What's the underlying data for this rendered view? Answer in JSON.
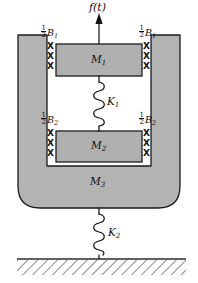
{
  "diagram": {
    "type": "mechanical-schematic",
    "colors": {
      "body_fill": "#b3b3b3",
      "block_fill": "#b0b0b0",
      "outline": "#1a1a1a",
      "ground_line": "#2b2b2b",
      "background": "#ffffff",
      "label_color": "#0d0d0d"
    },
    "force": {
      "label_main": "f",
      "label_paren_open": "(",
      "label_var": "t",
      "label_paren_close": ")",
      "label_full": "f(t)",
      "arrow_direction": "up",
      "icon": "up-arrow-icon"
    },
    "masses": [
      {
        "id": "M1",
        "label_main": "M",
        "label_sub": "1",
        "label_full": "M₁"
      },
      {
        "id": "M2",
        "label_main": "M",
        "label_sub": "2",
        "label_full": "M₂"
      },
      {
        "id": "M3",
        "label_main": "M",
        "label_sub": "3",
        "label_full": "M₃"
      }
    ],
    "springs": [
      {
        "id": "K1",
        "label_main": "K",
        "label_sub": "1",
        "label_full": "K₁",
        "between": "M1-M2"
      },
      {
        "id": "K2",
        "label_main": "K",
        "label_sub": "2",
        "label_full": "K₂",
        "between": "M3-ground"
      }
    ],
    "dampers": [
      {
        "id": "B1-left",
        "numerator": "1",
        "denominator": "2",
        "label_main": "B",
        "label_sub": "1",
        "label_full": "½B₁",
        "side": "left",
        "attached_to": "M1",
        "mark": "X",
        "mark_count": 3
      },
      {
        "id": "B1-right",
        "numerator": "1",
        "denominator": "2",
        "label_main": "B",
        "label_sub": "1",
        "label_full": "½B₁",
        "side": "right",
        "attached_to": "M1",
        "mark": "X",
        "mark_count": 3
      },
      {
        "id": "B2-left",
        "numerator": "1",
        "denominator": "2",
        "label_main": "B",
        "label_sub": "2",
        "label_full": "½B₂",
        "side": "left",
        "attached_to": "M2",
        "mark": "X",
        "mark_count": 3
      },
      {
        "id": "B2-right",
        "numerator": "1",
        "denominator": "2",
        "label_main": "B",
        "label_sub": "2",
        "label_full": "½B₂",
        "side": "right",
        "attached_to": "M2",
        "mark": "X",
        "mark_count": 3
      }
    ],
    "ground": {
      "name": "fixed-ground",
      "hatching": "diagonal"
    }
  }
}
